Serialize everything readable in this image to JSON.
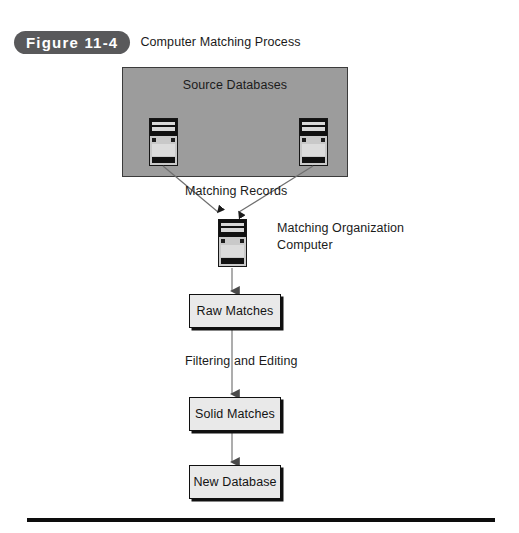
{
  "figure": {
    "number_label": "Figure 11-4",
    "title": "Computer Matching Process"
  },
  "diagram": {
    "source_panel": {
      "title": "Source Databases",
      "fill_color": "#9c9c9c",
      "border_color": "#3b3b3b",
      "icons": [
        {
          "name": "source-database-computer-left"
        },
        {
          "name": "source-database-computer-right"
        }
      ]
    },
    "labels": {
      "matching_records": "Matching Records",
      "matching_organization_computer": "Matching Organization Computer",
      "filtering_and_editing": "Filtering and Editing"
    },
    "center_icon": {
      "name": "matching-organization-computer-icon"
    },
    "flow_boxes": [
      {
        "id": "raw-matches",
        "label": "Raw Matches"
      },
      {
        "id": "solid-matches",
        "label": "Solid Matches"
      },
      {
        "id": "new-database",
        "label": "New Database"
      }
    ],
    "colors": {
      "box_fill": "#e9e9e9",
      "box_border": "#101010",
      "pill_background": "#59595b",
      "pill_text": "#ffffff",
      "connector": "#6f6f6f",
      "rule": "#0d0d0d"
    }
  }
}
